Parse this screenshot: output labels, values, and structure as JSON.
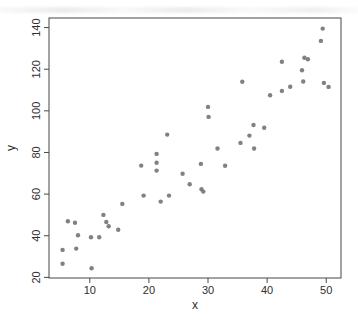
{
  "window": {
    "width_px": 358,
    "height_px": 325,
    "background": "#ffffff"
  },
  "chart_data": {
    "type": "scatter",
    "title": "",
    "xlabel": "x",
    "ylabel": "y",
    "x_ticks": [
      10,
      20,
      30,
      40,
      50
    ],
    "y_ticks": [
      20,
      40,
      60,
      80,
      100,
      120,
      140
    ],
    "xlim": [
      3.1,
      52.5
    ],
    "ylim": [
      19.7,
      144.6
    ],
    "grid": false,
    "legend_position": "none",
    "point_color": "#7a7a7a",
    "axis_color": "#474747",
    "label_color": "#2e2e2e",
    "point_radius_px": 2.2,
    "points": [
      [
        5.4,
        33.2
      ],
      [
        5.4,
        26.5
      ],
      [
        6.3,
        47.0
      ],
      [
        7.5,
        46.2
      ],
      [
        7.7,
        33.8
      ],
      [
        8.0,
        40.2
      ],
      [
        10.2,
        39.3
      ],
      [
        10.3,
        24.4
      ],
      [
        11.6,
        39.3
      ],
      [
        12.3,
        50.0
      ],
      [
        12.8,
        46.6
      ],
      [
        13.2,
        44.6
      ],
      [
        14.8,
        42.9
      ],
      [
        15.5,
        55.3
      ],
      [
        18.7,
        73.7
      ],
      [
        19.1,
        59.3
      ],
      [
        21.3,
        79.3
      ],
      [
        21.3,
        75.1
      ],
      [
        21.3,
        71.3
      ],
      [
        22.0,
        56.4
      ],
      [
        23.1,
        88.6
      ],
      [
        23.4,
        59.3
      ],
      [
        25.7,
        69.8
      ],
      [
        26.9,
        64.7
      ],
      [
        28.8,
        74.5
      ],
      [
        28.9,
        62.3
      ],
      [
        29.2,
        61.2
      ],
      [
        30.0,
        101.9
      ],
      [
        30.1,
        97.1
      ],
      [
        31.6,
        81.9
      ],
      [
        32.9,
        73.6
      ],
      [
        35.5,
        84.6
      ],
      [
        35.8,
        114.0
      ],
      [
        37.0,
        88.1
      ],
      [
        37.7,
        93.2
      ],
      [
        37.8,
        81.9
      ],
      [
        39.5,
        91.9
      ],
      [
        40.5,
        107.5
      ],
      [
        42.5,
        109.6
      ],
      [
        42.5,
        123.6
      ],
      [
        43.9,
        111.6
      ],
      [
        45.9,
        119.5
      ],
      [
        46.1,
        114.1
      ],
      [
        46.3,
        125.5
      ],
      [
        46.9,
        124.8
      ],
      [
        49.1,
        133.6
      ],
      [
        49.4,
        139.5
      ],
      [
        49.6,
        113.4
      ],
      [
        50.4,
        111.5
      ]
    ]
  }
}
